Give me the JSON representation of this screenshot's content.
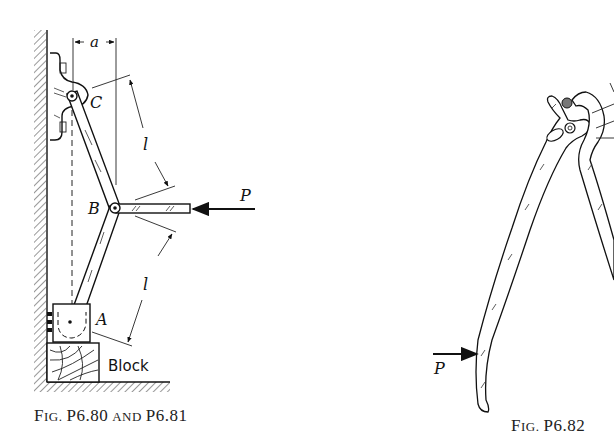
{
  "figures": [
    {
      "id": "fig-p6-80-81",
      "caption": "Fig. P6.80 and P6.81",
      "caption_parts": {
        "fig": "F",
        "ig": "IG.",
        "number": "P6.80",
        "and": "AND",
        "number2": "P6.81"
      },
      "labels": {
        "dimension_a": "a",
        "pin_c": "C",
        "pin_b": "B",
        "pin_a": "A",
        "length_upper": "l",
        "length_lower": "l",
        "force": "P",
        "block": "Block"
      }
    },
    {
      "id": "fig-p6-82",
      "caption": "Fig. P6.82",
      "caption_parts": {
        "fig": "F",
        "ig": "IG.",
        "number": "P6.82"
      },
      "labels": {
        "force": "P"
      }
    }
  ]
}
